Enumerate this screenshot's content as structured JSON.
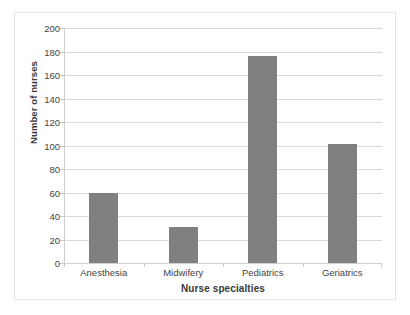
{
  "chart_data": {
    "type": "bar",
    "title": "",
    "categories": [
      "Anesthesia",
      "Midwifery",
      "Pediatrics",
      "Geriatrics"
    ],
    "values": [
      60,
      31,
      176,
      101
    ],
    "series": [
      {
        "name": "Number of nurses",
        "values": [
          60,
          31,
          176,
          101
        ]
      }
    ],
    "xlabel": "Nurse specialties",
    "ylabel": "Number of nurses",
    "ylim": [
      0,
      200
    ],
    "ytick_step": 20,
    "yticks": [
      200,
      180,
      160,
      140,
      120,
      100,
      80,
      60,
      40,
      20,
      0
    ],
    "ytick_labels": [
      "200",
      "180",
      "160",
      "140",
      "120",
      "100",
      "80",
      "60",
      "40",
      "20",
      "0"
    ],
    "grid": true,
    "grid_axis": "y",
    "legend": false,
    "legend_position": "none",
    "colors": {
      "bar": "#808080",
      "gridline": "#d9d9d9",
      "axis_line": "#cfcfcf",
      "background": "#ffffff",
      "border": "#e3e3e3",
      "text": "#3a3a3a"
    }
  }
}
